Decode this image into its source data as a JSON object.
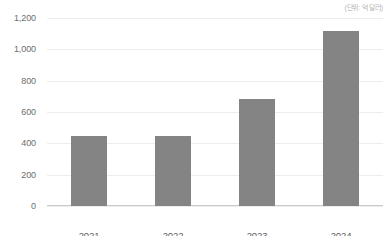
{
  "annotation": {
    "unit_note": "(단위: 억 달러)"
  },
  "chart_data": {
    "type": "bar",
    "title": "",
    "subtitle": "",
    "xlabel": "",
    "ylabel": "",
    "unit_note": "(단위: 억 달러)",
    "categories": [
      "2021",
      "2022",
      "2023",
      "2024"
    ],
    "values": [
      450,
      450,
      680,
      1120
    ],
    "ylim": [
      0,
      1200
    ],
    "ytick_values": [
      0,
      200,
      400,
      600,
      800,
      1000,
      1200
    ],
    "ytick_labels": [
      "0",
      "200",
      "400",
      "600",
      "800",
      "1,000",
      "1,200"
    ],
    "grid": true,
    "legend": false,
    "legend_position": "none",
    "series": [
      {
        "name": "",
        "values": [
          450,
          450,
          680,
          1120
        ],
        "color": "#848484"
      }
    ],
    "colors": {
      "bar": "#848484",
      "gridline": "#ededed",
      "axis": "#c9c9c9",
      "tick_text": "#6d6d6d",
      "category_text": "#5c5c5c",
      "annotation_text": "#b6b6b6",
      "background": "#ffffff"
    }
  }
}
